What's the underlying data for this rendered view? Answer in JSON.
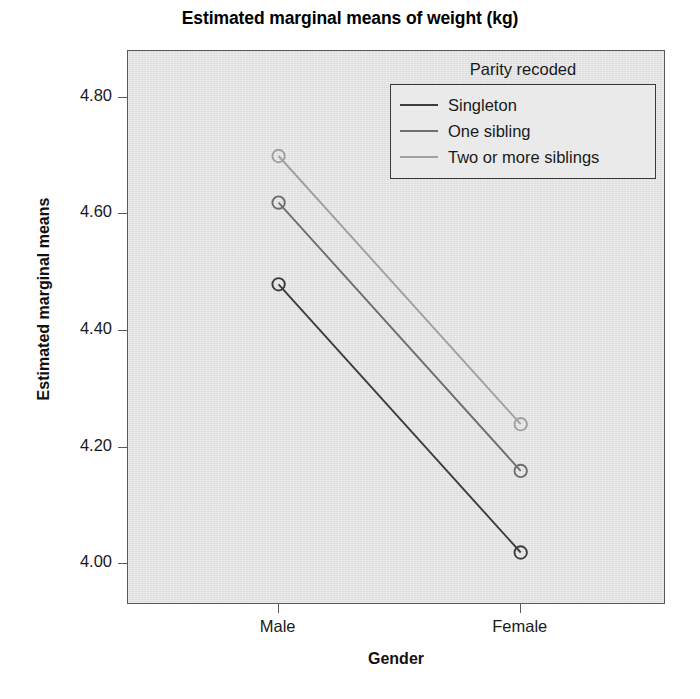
{
  "chart_data": {
    "type": "line",
    "title": "Estimated marginal means of weight (kg)",
    "xlabel": "Gender",
    "ylabel": "Estimated marginal means",
    "categories": [
      "Male",
      "Female"
    ],
    "x_tick_labels": [
      "Male",
      "Female"
    ],
    "y_tick_labels": [
      "4.80",
      "4.60",
      "4.40",
      "4.20",
      "4.00"
    ],
    "y_ticks": [
      4.8,
      4.6,
      4.4,
      4.2,
      4.0
    ],
    "ylim": [
      3.93,
      4.88
    ],
    "grid": false,
    "legend_position": "inside-top-right",
    "legend_title": "Parity recoded",
    "markers": "open-circle",
    "series": [
      {
        "name": "Singleton",
        "values": [
          4.48,
          4.02
        ],
        "color": "#3d3d3d"
      },
      {
        "name": "One sibling",
        "values": [
          4.62,
          4.16
        ],
        "color": "#6f6f6f"
      },
      {
        "name": "Two or more siblings",
        "values": [
          4.7,
          4.24
        ],
        "color": "#a0a0a0"
      }
    ]
  },
  "chart": {
    "title": "Estimated marginal means of weight (kg)",
    "y_axis_title": "Estimated marginal means",
    "x_axis_title": "Gender",
    "y_tick_0": "4.80",
    "y_tick_1": "4.60",
    "y_tick_2": "4.40",
    "y_tick_3": "4.20",
    "y_tick_4": "4.00",
    "x_tick_0": "Male",
    "x_tick_1": "Female",
    "plot_background_color": "#e2e2e2",
    "frame_color": "#5a5a5a"
  },
  "legend": {
    "title": "Parity recoded",
    "items": [
      {
        "label": "Singleton",
        "color": "#3d3d3d"
      },
      {
        "label": "One sibling",
        "color": "#6f6f6f"
      },
      {
        "label": "Two or more siblings",
        "color": "#a0a0a0"
      }
    ]
  }
}
